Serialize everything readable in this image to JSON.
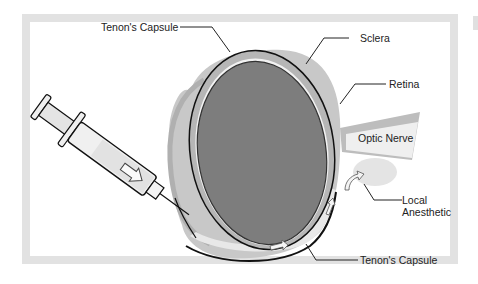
{
  "figure": {
    "type": "anatomical diagram"
  },
  "labels": {
    "tenons_capsule_top": "Tenon's Capsule",
    "sclera": "Sclera",
    "retina": "Retina",
    "optic_nerve": "Optic Nerve",
    "local_anesthetic_line1": "Local",
    "local_anesthetic_line2": "Anesthetic",
    "tenons_capsule_bottom": "Tenon's Capsule"
  },
  "colors": {
    "frame": "#e2e2e2",
    "eyeball": "#7d7d7d",
    "sclera": "#b4b4b4",
    "tenons_layer": "#c9c9c9",
    "anesthetic": "#e6e6e6",
    "outline": "#111111",
    "syringe_fill": "#efefef"
  }
}
